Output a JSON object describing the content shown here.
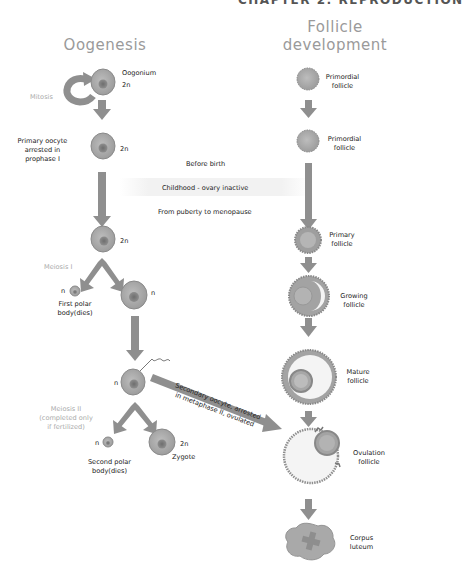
{
  "header": {
    "text": "CHAPTER 2: REPRODUCTION"
  },
  "columns": {
    "oogenesis_title": "Oogenesis",
    "follicle_title_line1": "Follicle",
    "follicle_title_line2": "development"
  },
  "timeline": {
    "before_birth": "Before birth",
    "childhood": "Childhood - ovary inactive",
    "puberty": "From puberty to menopause"
  },
  "oogenesis": {
    "oogonium": {
      "label": "Oogonium",
      "ploidy": "2n"
    },
    "mitosis": "Mitosis",
    "primary_oocyte": {
      "line1": "Primary oocyte",
      "line2": "arrested in",
      "line3": "prophase I",
      "ploidy": "2n"
    },
    "primary_oocyte_2": {
      "ploidy": "2n"
    },
    "meiosis1": "Meiosis I",
    "first_polar_body": {
      "ploidy": "n",
      "line1": "First polar",
      "line2": "body(dies)"
    },
    "secondary_cell": {
      "ploidy": "n"
    },
    "secondary_oocyte": {
      "ploidy": "n"
    },
    "ovulated_arrow_label": {
      "line1": "Secondary oocyte, arrested",
      "line2": "in metaphase II, ovulated"
    },
    "meiosis2": {
      "line1": "Meiosis II",
      "line2": "(completed only",
      "line3": "if fertilized)"
    },
    "second_polar_body": {
      "ploidy": "n",
      "line1": "Second polar",
      "line2": "body(dies)"
    },
    "zygote": {
      "label": "Zygote",
      "ploidy": "2n"
    }
  },
  "follicles": [
    {
      "line1": "Primordial",
      "line2": "follicle"
    },
    {
      "line1": "Primordial",
      "line2": "follicle"
    },
    {
      "line1": "Primary",
      "line2": "follicle"
    },
    {
      "line1": "Growing",
      "line2": "follicle"
    },
    {
      "line1": "Mature",
      "line2": "follicle"
    },
    {
      "line1": "Ovulation",
      "line2": "follicle"
    },
    {
      "line1": "Corpus",
      "line2": "luteum"
    }
  ],
  "colors": {
    "arrow": "#8f8f8f",
    "cell": "#a8a8a8",
    "nucleus": "#7c7c7c",
    "title": "#9a9a9a"
  }
}
